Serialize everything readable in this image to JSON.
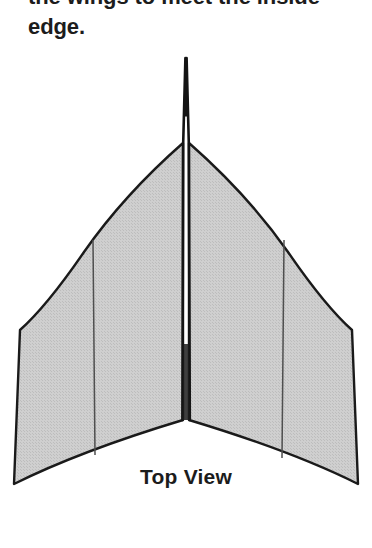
{
  "page": {
    "background_color": "#ffffff",
    "width": 372,
    "height": 548
  },
  "instructions": {
    "line_clipped": "the wings to meet the inside",
    "line_visible": "edge."
  },
  "figure": {
    "caption": "Top View",
    "fill_color": "#c9c9c9",
    "stroke_color": "#1a1a1a",
    "keel_color": "#141414",
    "fold_line_color": "#4a4a4a",
    "geometry": {
      "nose_tip": [
        186,
        14
      ],
      "keel_base": [
        186,
        376
      ],
      "wing_root": [
        186,
        99
      ],
      "left_wing_tip_front": [
        20,
        286
      ],
      "left_wing_tip_rear": [
        14,
        440
      ],
      "right_wing_tip_front": [
        352,
        286
      ],
      "right_wing_tip_rear": [
        358,
        440
      ],
      "tail_notch": [
        186,
        376
      ],
      "left_fold_top": [
        93,
        196
      ],
      "left_fold_bottom": [
        95,
        411
      ],
      "right_fold_top": [
        284,
        196
      ],
      "right_fold_bottom": [
        282,
        414
      ]
    }
  }
}
